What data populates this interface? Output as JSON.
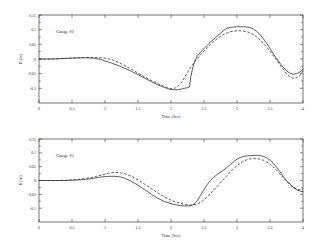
{
  "figure": {
    "background": "#ffffff",
    "line_color": "#2a2a2a",
    "axis_color": "#3a3a3a"
  },
  "chart_data": [
    {
      "type": "line",
      "title": "",
      "annotation": "Gauge #2",
      "xlabel": "Time (Sec)",
      "ylabel": "R (in)",
      "xlim": [
        0,
        4
      ],
      "ylim": [
        -0.15,
        0.15
      ],
      "xticks": [
        0,
        0.5,
        1,
        1.5,
        2,
        2.5,
        3,
        3.5,
        4
      ],
      "xticklabels": [
        "0",
        "0.5",
        "1",
        "1.5",
        "2",
        "2.5",
        "3",
        "3.5",
        "4"
      ],
      "yticks": [
        0.15,
        0.1,
        0.05,
        0,
        -0.05,
        -0.1
      ],
      "yticklabels": [
        "0.15",
        "0.1",
        "0.05",
        "0",
        "-0.05",
        "-0.1"
      ],
      "grid": false,
      "legend": "none",
      "series": [
        {
          "name": "measured",
          "style": "solid",
          "x": [
            0.0,
            0.1,
            0.2,
            0.3,
            0.4,
            0.5,
            0.6,
            0.7,
            0.75,
            0.8,
            0.85,
            0.9,
            0.95,
            1.0,
            1.05,
            1.1,
            1.15,
            1.2,
            1.25,
            1.3,
            1.4,
            1.5,
            1.6,
            1.7,
            1.8,
            1.9,
            1.95,
            2.0,
            2.05,
            2.1,
            2.12,
            2.15,
            2.17,
            2.18,
            2.2,
            2.22,
            2.25,
            2.28,
            2.3,
            2.33,
            2.36,
            2.4,
            2.45,
            2.5,
            2.55,
            2.6,
            2.65,
            2.7,
            2.75,
            2.8,
            2.85,
            2.9,
            2.95,
            3.0,
            3.05,
            3.1,
            3.15,
            3.2,
            3.25,
            3.3,
            3.35,
            3.4,
            3.45,
            3.5,
            3.55,
            3.6,
            3.65,
            3.7,
            3.75,
            3.8,
            3.85,
            3.9,
            3.95,
            4.0
          ],
          "y": [
            0.0,
            0.0,
            0.0,
            0.001,
            0.002,
            0.003,
            0.004,
            0.004,
            0.004,
            0.003,
            0.002,
            0.0,
            -0.003,
            -0.007,
            -0.01,
            -0.014,
            -0.018,
            -0.022,
            -0.027,
            -0.032,
            -0.042,
            -0.053,
            -0.065,
            -0.077,
            -0.088,
            -0.097,
            -0.101,
            -0.104,
            -0.105,
            -0.105,
            -0.104,
            -0.103,
            -0.102,
            -0.101,
            -0.1,
            -0.099,
            -0.098,
            -0.096,
            -0.06,
            -0.03,
            -0.008,
            0.01,
            0.024,
            0.035,
            0.047,
            0.058,
            0.068,
            0.078,
            0.088,
            0.098,
            0.105,
            0.108,
            0.109,
            0.11,
            0.11,
            0.11,
            0.109,
            0.107,
            0.102,
            0.094,
            0.083,
            0.069,
            0.053,
            0.036,
            0.018,
            0.001,
            -0.014,
            -0.028,
            -0.04,
            -0.048,
            -0.052,
            -0.05,
            -0.045,
            -0.033
          ]
        },
        {
          "name": "computed",
          "style": "dashed",
          "x": [
            0.0,
            0.1,
            0.2,
            0.3,
            0.4,
            0.5,
            0.6,
            0.7,
            0.8,
            0.9,
            0.95,
            1.0,
            1.05,
            1.1,
            1.15,
            1.2,
            1.25,
            1.3,
            1.4,
            1.5,
            1.6,
            1.7,
            1.8,
            1.9,
            1.95,
            2.0,
            2.05,
            2.1,
            2.15,
            2.2,
            2.25,
            2.3,
            2.35,
            2.4,
            2.45,
            2.5,
            2.55,
            2.6,
            2.65,
            2.7,
            2.75,
            2.8,
            2.85,
            2.9,
            2.95,
            3.0,
            3.05,
            3.1,
            3.15,
            3.2,
            3.25,
            3.3,
            3.35,
            3.4,
            3.45,
            3.5,
            3.55,
            3.6,
            3.65,
            3.7,
            3.75,
            3.8,
            3.85,
            3.9,
            3.95,
            4.0
          ],
          "y": [
            0.0,
            0.0,
            0.0,
            0.001,
            0.002,
            0.003,
            0.004,
            0.005,
            0.005,
            0.004,
            0.004,
            0.003,
            0.001,
            -0.002,
            -0.006,
            -0.011,
            -0.017,
            -0.023,
            -0.035,
            -0.048,
            -0.061,
            -0.073,
            -0.084,
            -0.094,
            -0.098,
            -0.101,
            -0.1,
            -0.095,
            -0.083,
            -0.065,
            -0.046,
            -0.028,
            -0.012,
            0.002,
            0.015,
            0.027,
            0.039,
            0.05,
            0.06,
            0.069,
            0.077,
            0.084,
            0.089,
            0.093,
            0.095,
            0.096,
            0.096,
            0.095,
            0.093,
            0.089,
            0.083,
            0.075,
            0.065,
            0.053,
            0.04,
            0.026,
            0.011,
            -0.004,
            -0.02,
            -0.035,
            -0.05,
            -0.061,
            -0.066,
            -0.064,
            -0.056,
            -0.04
          ]
        }
      ]
    },
    {
      "type": "line",
      "title": "",
      "annotation": "Gauge #5",
      "xlabel": "Time (Sec)",
      "ylabel": "R (in)",
      "xlim": [
        0,
        4
      ],
      "ylim": [
        -0.15,
        0.15
      ],
      "xticks": [
        0,
        0.5,
        1,
        1.5,
        2,
        2.5,
        3,
        3.5,
        4
      ],
      "xticklabels": [
        "0",
        "0.5",
        "1",
        "1.5",
        "2",
        "2.5",
        "3",
        "3.5",
        "4"
      ],
      "yticks": [
        0.15,
        0.1,
        0.05,
        0,
        -0.05,
        -0.1
      ],
      "yticklabels": [
        "0.15",
        "0.1",
        "0.05",
        "0",
        "-0.05",
        "-0.1"
      ],
      "grid": false,
      "legend": "none",
      "series": [
        {
          "name": "measured",
          "style": "solid",
          "x": [
            0.0,
            0.1,
            0.2,
            0.3,
            0.4,
            0.5,
            0.6,
            0.7,
            0.8,
            0.85,
            0.9,
            0.95,
            1.0,
            1.05,
            1.1,
            1.15,
            1.2,
            1.25,
            1.3,
            1.35,
            1.4,
            1.45,
            1.5,
            1.55,
            1.6,
            1.65,
            1.7,
            1.75,
            1.8,
            1.85,
            1.9,
            1.95,
            2.0,
            2.05,
            2.1,
            2.15,
            2.2,
            2.25,
            2.3,
            2.35,
            2.4,
            2.45,
            2.5,
            2.55,
            2.6,
            2.65,
            2.7,
            2.75,
            2.8,
            2.85,
            2.9,
            2.95,
            3.0,
            3.05,
            3.1,
            3.15,
            3.2,
            3.25,
            3.3,
            3.35,
            3.4,
            3.45,
            3.5,
            3.55,
            3.6,
            3.65,
            3.7,
            3.75,
            3.8,
            3.85,
            3.9,
            3.95,
            4.0
          ],
          "y": [
            0.0,
            0.0,
            0.0,
            0.0,
            0.0,
            0.001,
            0.002,
            0.004,
            0.007,
            0.009,
            0.011,
            0.013,
            0.014,
            0.015,
            0.015,
            0.015,
            0.014,
            0.012,
            0.008,
            0.003,
            -0.003,
            -0.01,
            -0.017,
            -0.025,
            -0.033,
            -0.041,
            -0.049,
            -0.057,
            -0.064,
            -0.07,
            -0.076,
            -0.08,
            -0.084,
            -0.087,
            -0.089,
            -0.091,
            -0.092,
            -0.092,
            -0.091,
            -0.085,
            -0.072,
            -0.053,
            -0.032,
            -0.014,
            0.0,
            0.012,
            0.022,
            0.03,
            0.038,
            0.048,
            0.058,
            0.068,
            0.077,
            0.083,
            0.087,
            0.089,
            0.09,
            0.091,
            0.091,
            0.09,
            0.087,
            0.082,
            0.074,
            0.062,
            0.048,
            0.032,
            0.015,
            0.0,
            -0.013,
            -0.024,
            -0.033,
            -0.038,
            -0.04
          ]
        },
        {
          "name": "computed",
          "style": "dashed",
          "x": [
            0.0,
            0.1,
            0.2,
            0.3,
            0.4,
            0.5,
            0.6,
            0.7,
            0.8,
            0.85,
            0.9,
            0.95,
            1.0,
            1.05,
            1.1,
            1.15,
            1.2,
            1.25,
            1.3,
            1.35,
            1.4,
            1.45,
            1.5,
            1.55,
            1.6,
            1.65,
            1.7,
            1.75,
            1.8,
            1.85,
            1.9,
            1.95,
            2.0,
            2.05,
            2.1,
            2.15,
            2.2,
            2.25,
            2.3,
            2.35,
            2.4,
            2.45,
            2.5,
            2.55,
            2.6,
            2.65,
            2.7,
            2.75,
            2.8,
            2.85,
            2.9,
            2.95,
            3.0,
            3.05,
            3.1,
            3.15,
            3.2,
            3.25,
            3.3,
            3.35,
            3.4,
            3.45,
            3.5,
            3.55,
            3.6,
            3.65,
            3.7,
            3.75,
            3.8,
            3.85,
            3.9,
            3.95,
            4.0
          ],
          "y": [
            0.0,
            0.0,
            0.0,
            0.0,
            0.001,
            0.002,
            0.004,
            0.007,
            0.011,
            0.014,
            0.017,
            0.02,
            0.023,
            0.026,
            0.028,
            0.029,
            0.029,
            0.027,
            0.024,
            0.02,
            0.015,
            0.009,
            0.002,
            -0.005,
            -0.013,
            -0.021,
            -0.029,
            -0.037,
            -0.045,
            -0.052,
            -0.059,
            -0.065,
            -0.071,
            -0.076,
            -0.08,
            -0.083,
            -0.086,
            -0.088,
            -0.089,
            -0.088,
            -0.085,
            -0.079,
            -0.07,
            -0.059,
            -0.047,
            -0.034,
            -0.021,
            -0.008,
            0.005,
            0.018,
            0.031,
            0.043,
            0.054,
            0.063,
            0.07,
            0.075,
            0.078,
            0.079,
            0.079,
            0.077,
            0.073,
            0.067,
            0.059,
            0.049,
            0.037,
            0.024,
            0.011,
            -0.002,
            -0.014,
            -0.024,
            -0.031,
            -0.033,
            -0.03
          ]
        }
      ]
    }
  ]
}
